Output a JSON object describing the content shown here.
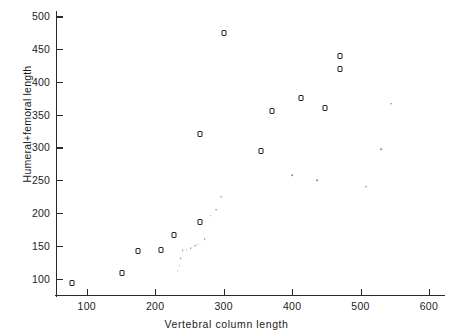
{
  "figure": {
    "background": "#ffffff",
    "marker_color": "#1b1b1b",
    "dot_color": "#8a8a8a"
  },
  "chart_data": {
    "type": "scatter",
    "title": "",
    "xlabel": "Vertebral column length",
    "ylabel": "Humeral+femoral length",
    "xlim": [
      55,
      625
    ],
    "ylim": [
      75,
      505
    ],
    "xticks": [
      100,
      200,
      300,
      400,
      500,
      600
    ],
    "yticks": [
      100,
      150,
      200,
      250,
      300,
      350,
      400,
      450,
      500
    ],
    "xtick_labels": [
      "100",
      "200",
      "300",
      "400",
      "500",
      "600"
    ],
    "ytick_labels": [
      "100",
      "150",
      "200",
      "250",
      "300",
      "350",
      "400",
      "450",
      "500"
    ],
    "grid": false,
    "legend": "none",
    "series": [
      {
        "name": "open-square-specimens",
        "marker": "open-square",
        "points": [
          {
            "x": 78,
            "y": 93
          },
          {
            "x": 152,
            "y": 108
          },
          {
            "x": 175,
            "y": 142
          },
          {
            "x": 208,
            "y": 144
          },
          {
            "x": 228,
            "y": 167
          },
          {
            "x": 265,
            "y": 186
          },
          {
            "x": 265,
            "y": 320
          },
          {
            "x": 300,
            "y": 475
          },
          {
            "x": 355,
            "y": 295
          },
          {
            "x": 370,
            "y": 355
          },
          {
            "x": 413,
            "y": 375
          },
          {
            "x": 448,
            "y": 360
          },
          {
            "x": 470,
            "y": 440
          },
          {
            "x": 470,
            "y": 420
          }
        ]
      },
      {
        "name": "small-dot-specimens",
        "marker": "dot",
        "points": [
          {
            "x": 233,
            "y": 112
          },
          {
            "x": 236,
            "y": 120
          },
          {
            "x": 237,
            "y": 131
          },
          {
            "x": 240,
            "y": 143
          },
          {
            "x": 246,
            "y": 144
          },
          {
            "x": 252,
            "y": 146
          },
          {
            "x": 258,
            "y": 150
          },
          {
            "x": 262,
            "y": 152
          },
          {
            "x": 272,
            "y": 160
          },
          {
            "x": 281,
            "y": 196
          },
          {
            "x": 289,
            "y": 205
          },
          {
            "x": 296,
            "y": 225
          },
          {
            "x": 400,
            "y": 258
          },
          {
            "x": 437,
            "y": 250
          },
          {
            "x": 508,
            "y": 240
          },
          {
            "x": 530,
            "y": 297
          },
          {
            "x": 545,
            "y": 367
          }
        ]
      }
    ]
  }
}
